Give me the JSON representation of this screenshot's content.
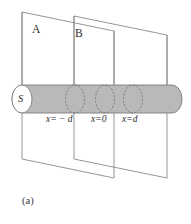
{
  "figure": {
    "caption": "(a)",
    "background_color": "#ffffff",
    "line_color": "#8a8a8a",
    "cylinder_fill": "#b9b9b9",
    "planes": [
      {
        "id": "plane-a",
        "label": "A",
        "label_x": 32,
        "label_y": 29,
        "points": "22,12 114,31 114,178 22,159",
        "left_x": 22,
        "right_x": 114
      },
      {
        "id": "plane-b",
        "label": "B",
        "label_x": 75,
        "label_y": 34,
        "points": "74,16 167,35 167,178 74,159",
        "left_x": 74,
        "right_x": 167
      }
    ],
    "cylinder": {
      "source_label": "S",
      "left_x": 12,
      "right_x": 182,
      "top_y": 85,
      "bottom_y": 113,
      "center_y": 99,
      "cap_rx": 10,
      "cap_ry": 14
    },
    "cross_sections": [
      {
        "id": "section-minus-d",
        "label": "x= − d",
        "center_x": 75,
        "label_x": 46,
        "label_y": 119
      },
      {
        "id": "section-zero",
        "label": "x=0",
        "center_x": 105,
        "label_x": 91,
        "label_y": 119
      },
      {
        "id": "section-plus-d",
        "label": "x=d",
        "center_x": 133,
        "label_x": 122,
        "label_y": 119
      }
    ],
    "section_rx": 9.5,
    "section_ry": 14
  }
}
